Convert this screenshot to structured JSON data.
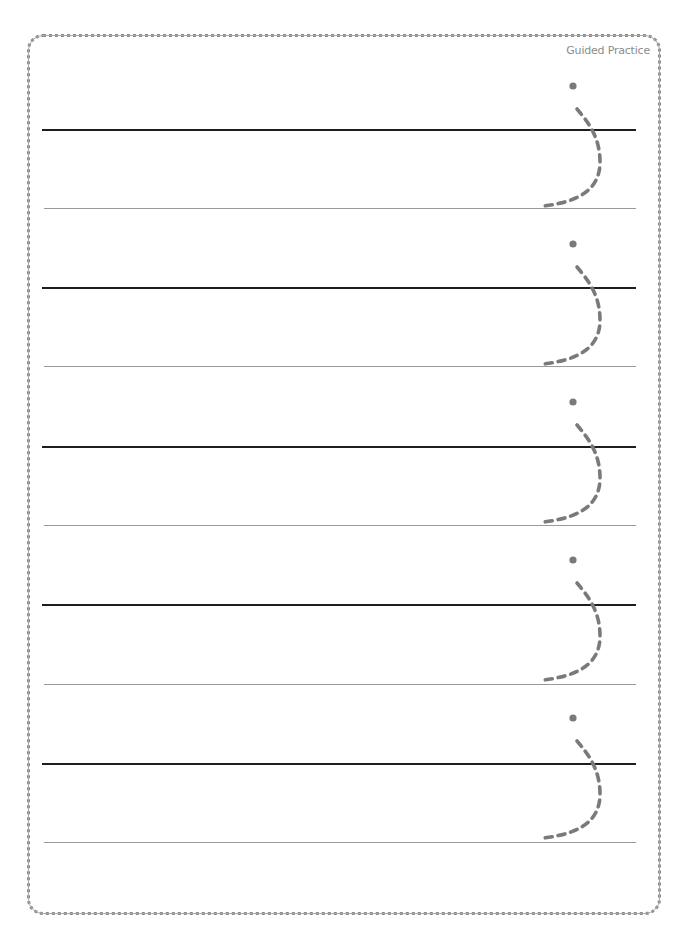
{
  "page": {
    "header_label": "Guided Practice",
    "colors": {
      "border": "#8a8a8a",
      "top_line": "#1e1e1e",
      "base_line": "#9a9a9a",
      "tracing_stroke": "#7a7a7a",
      "label": "#8c8c8c"
    }
  },
  "rows": [
    {
      "index": 1,
      "glyph": "j",
      "top_line_y": 129,
      "base_line_y": 208,
      "dot_y": 86
    },
    {
      "index": 2,
      "glyph": "j",
      "top_line_y": 287,
      "base_line_y": 366,
      "dot_y": 244
    },
    {
      "index": 3,
      "glyph": "j",
      "top_line_y": 446,
      "base_line_y": 525,
      "dot_y": 402
    },
    {
      "index": 4,
      "glyph": "j",
      "top_line_y": 604,
      "base_line_y": 684,
      "dot_y": 560
    },
    {
      "index": 5,
      "glyph": "j",
      "top_line_y": 763,
      "base_line_y": 842,
      "dot_y": 718
    }
  ]
}
